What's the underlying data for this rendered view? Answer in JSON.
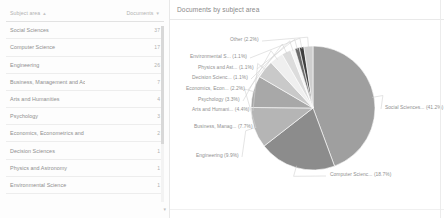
{
  "table": {
    "columns": [
      {
        "label": "Subject area",
        "sort": "▲"
      },
      {
        "label": "Documents",
        "sort": "▼"
      }
    ],
    "rows": [
      {
        "subject": "Social Sciences",
        "documents": "37"
      },
      {
        "subject": "Computer Science",
        "documents": "17"
      },
      {
        "subject": "Engineering",
        "documents": "26"
      },
      {
        "subject": "Business, Management and Accounting",
        "documents": "7"
      },
      {
        "subject": "Arts and Humanities",
        "documents": "4"
      },
      {
        "subject": "Psychology",
        "documents": "3"
      },
      {
        "subject": "Economics, Econometrics and Finance",
        "documents": "2"
      },
      {
        "subject": "Decision Sciences",
        "documents": "1"
      },
      {
        "subject": "Physics and Astronomy",
        "documents": "1"
      },
      {
        "subject": "Environmental Science",
        "documents": "1"
      }
    ],
    "scroll_arrow": "▾"
  },
  "chart": {
    "title": "Documents by subject area"
  },
  "chart_data": {
    "type": "pie",
    "title": "Documents by subject area",
    "legend": "labels-with-leader-lines",
    "grid": false,
    "labels": [
      "Social Sciences...",
      "Computer Scienc...",
      "Engineering",
      "Business, Manag...",
      "Arts and Humani...",
      "Psychology",
      "Economics, Econ...",
      "Decision Scienc...",
      "Physics and Ast...",
      "Environmental S...",
      "Other"
    ],
    "values": [
      41.2,
      18.7,
      9.9,
      7.7,
      4.4,
      3.3,
      2.2,
      1.1,
      1.1,
      1.1,
      2.2
    ],
    "display_labels": [
      "Social Sciences... (41.2%)",
      "Computer Scienc... (18.7%)",
      "Engineering (9.9%)",
      "Business, Manag... (7.7%)",
      "Arts and Humani... (4.4%)",
      "Psychology (3.3%)",
      "Economics, Econ... (2.2%)",
      "Decision Scienc... (1.1%)",
      "Physics and Ast... (1.1%)",
      "Environmental S... (1.1%)",
      "Other (2.2%)"
    ],
    "colors": [
      "#9f9f9f",
      "#8c8c8c",
      "#b5b5b5",
      "#a8a8a8",
      "#c9c9c9",
      "#efefef",
      "#dcdcdc",
      "#f5f5f5",
      "#6d6d6d",
      "#3f3f3f",
      "#cfcfcf"
    ],
    "units": "percent"
  }
}
